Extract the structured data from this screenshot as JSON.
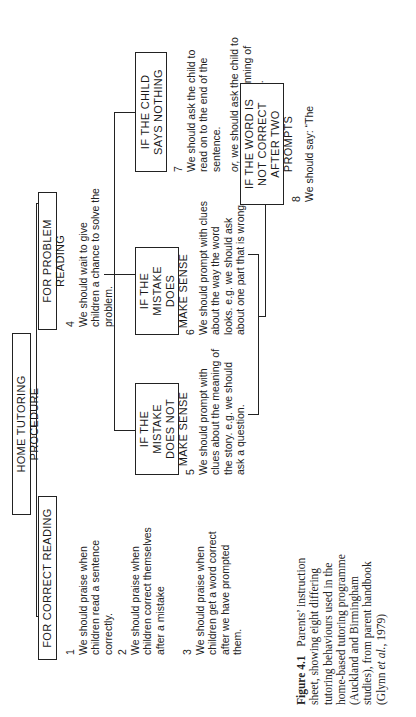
{
  "title": "HOME TUTORING PROCEDURE",
  "branches": {
    "correct": {
      "label": "FOR CORRECT READING",
      "items": [
        {
          "num": "1",
          "text": "We should praise when children read a sentence correctly."
        },
        {
          "num": "2",
          "text": "We should praise when children correct themselves after a mistake"
        },
        {
          "num": "3",
          "text": "We should praise when children get a word correct after we have prompted them."
        }
      ]
    },
    "problem": {
      "label": "FOR PROBLEM READING",
      "item4": {
        "num": "4",
        "text": "We should wait to give children a chance to solve the problem."
      },
      "cases": [
        {
          "label_l1": "IF THE MISTAKE",
          "label_l2": "DOES NOT",
          "label_l3": "MAKE SENSE",
          "num": "5",
          "text": "We should prompt with clues about the meaning of the story.",
          "example": "e.g. we should ask a question."
        },
        {
          "label_l1": "IF THE MISTAKE",
          "label_l2": "DOES",
          "label_l3": "MAKE SENSE",
          "num": "6",
          "text": "We should prompt with clues about the way the word looks.",
          "example": "e.g. we should ask about one part that is wrong."
        },
        {
          "label_l1": "IF THE CHILD",
          "label_l2": "SAYS NOTHING",
          "num": "7",
          "text": "We should ask the child to read on to the end of the sentence.",
          "alt_prefix": "or,",
          "alt": " we should ask the child to go back to the beginning of the sentence again."
        }
      ],
      "after_prompts": {
        "label_l1": "IF THE WORD IS",
        "label_l2": "NOT CORRECT",
        "label_l3": "AFTER TWO PROMPTS",
        "num": "8",
        "text": "We should say: “The"
      }
    }
  },
  "caption": {
    "figure_label": "Figure 4.1",
    "text_a": "Parents’ instruction sheet, showing eight differing tutoring behaviours used in the home-based tutoring programme (Auckland and Birmingham studies), from parent handbook (Glynn ",
    "et_al": "et al.",
    "text_b": ", 1979)"
  }
}
